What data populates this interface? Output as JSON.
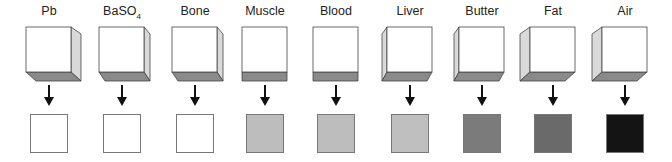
{
  "figure": {
    "items": [
      {
        "label": "Pb",
        "sub": "",
        "result_color": "#ffffff",
        "view": "right"
      },
      {
        "label": "BaSO",
        "sub": "4",
        "result_color": "#ffffff",
        "view": "right-small"
      },
      {
        "label": "Bone",
        "sub": "",
        "result_color": "#ffffff",
        "view": "right-small"
      },
      {
        "label": "Muscle",
        "sub": "",
        "result_color": "#bdbdbd",
        "view": "bottom"
      },
      {
        "label": "Blood",
        "sub": "",
        "result_color": "#bdbdbd",
        "view": "bottom"
      },
      {
        "label": "Liver",
        "sub": "",
        "result_color": "#bfbfbf",
        "view": "left-small"
      },
      {
        "label": "Butter",
        "sub": "",
        "result_color": "#7b7b7b",
        "view": "left-small"
      },
      {
        "label": "Fat",
        "sub": "",
        "result_color": "#6a6a6a",
        "view": "left"
      },
      {
        "label": "Air",
        "sub": "",
        "result_color": "#141414",
        "view": "left"
      }
    ],
    "arrow_glyph": "down-arrow"
  }
}
